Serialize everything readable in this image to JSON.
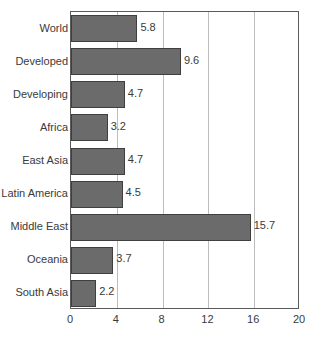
{
  "chart_data": {
    "type": "bar",
    "orientation": "horizontal",
    "title": "",
    "xlabel": "",
    "ylabel": "",
    "xlim": [
      0,
      20
    ],
    "xticks": [
      0,
      4,
      8,
      12,
      16,
      20
    ],
    "grid": true,
    "legend": "none",
    "bar_color": "#6b6b6b",
    "bar_border_color": "#3f3f3f",
    "gridline_color": "#bdbdbd",
    "axis_color": "#5a5a5a",
    "text_color": "#3a3a3a",
    "categories": [
      "World",
      "Developed",
      "Developing",
      "Africa",
      "East Asia",
      "Latin America",
      "Middle East",
      "Oceania",
      "South Asia"
    ],
    "values": [
      5.8,
      9.6,
      4.7,
      3.2,
      4.7,
      4.5,
      15.7,
      3.7,
      2.2
    ],
    "value_labels": [
      "5.8",
      "9.6",
      "4.7",
      "3.2",
      "4.7",
      "4.5",
      "15.7",
      "3.7",
      "2.2"
    ],
    "tick_labels": [
      "0",
      "4",
      "8",
      "12",
      "16",
      "20"
    ]
  }
}
